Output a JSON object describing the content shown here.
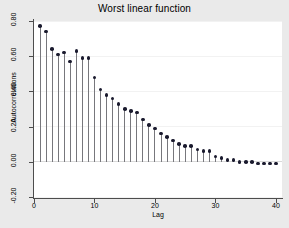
{
  "chart_data": {
    "type": "bar",
    "title": "Worst linear function",
    "xlabel": "Lag",
    "ylabel": "Autocorrelations",
    "xlim": [
      0,
      41
    ],
    "ylim": [
      -0.2,
      0.8
    ],
    "grid": true,
    "legend": "none",
    "x_ticks": [
      "0",
      "10",
      "20",
      "30",
      "40"
    ],
    "x_tick_values": [
      0,
      10,
      20,
      30,
      40
    ],
    "y_ticks": [
      "-0.20",
      "0.00",
      "0.20",
      "0.40",
      "0.60",
      "0.80"
    ],
    "y_tick_values": [
      -0.2,
      0.0,
      0.2,
      0.4,
      0.6,
      0.8
    ],
    "categories": [
      1,
      2,
      3,
      4,
      5,
      6,
      7,
      8,
      9,
      10,
      11,
      12,
      13,
      14,
      15,
      16,
      17,
      18,
      19,
      20,
      21,
      22,
      23,
      24,
      25,
      26,
      27,
      28,
      29,
      30,
      31,
      32,
      33,
      34,
      35,
      36,
      37,
      38,
      39,
      40
    ],
    "values": [
      0.77,
      0.74,
      0.64,
      0.61,
      0.62,
      0.57,
      0.63,
      0.59,
      0.59,
      0.48,
      0.41,
      0.38,
      0.36,
      0.33,
      0.3,
      0.29,
      0.28,
      0.24,
      0.21,
      0.19,
      0.16,
      0.14,
      0.12,
      0.1,
      0.09,
      0.09,
      0.07,
      0.06,
      0.06,
      0.03,
      0.02,
      0.01,
      0.01,
      0.0,
      0.0,
      0.0,
      -0.01,
      -0.01,
      -0.01,
      -0.01
    ]
  },
  "colors": {
    "page_background": "#eaeaea",
    "plot_background": "#ffffff",
    "gridline": "#f2f2f2",
    "axis": "#4d4d4d",
    "spike": "#77777c",
    "marker": "#1a1a2e"
  }
}
